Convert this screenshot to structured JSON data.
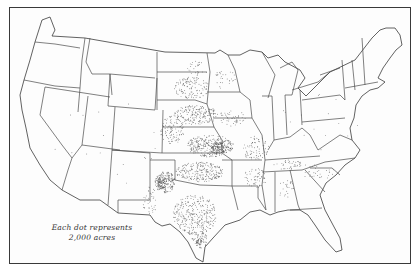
{
  "map": {
    "type": "dot-density",
    "region": "United States",
    "legend": {
      "line1": "Each dot represents",
      "line2": "2,000 acres"
    },
    "colors": {
      "ink": "#3a3a3a",
      "dot": "#555555",
      "paper": "#fdfdfd"
    },
    "dot_clusters": [
      {
        "name": "south-dakota",
        "cx": 192,
        "cy": 88,
        "rx": 18,
        "ry": 11,
        "n": 120
      },
      {
        "name": "north-dakota-east",
        "cx": 197,
        "cy": 70,
        "rx": 10,
        "ry": 9,
        "n": 30
      },
      {
        "name": "nebraska",
        "cx": 196,
        "cy": 115,
        "rx": 22,
        "ry": 10,
        "n": 200
      },
      {
        "name": "kansas",
        "cx": 210,
        "cy": 146,
        "rx": 24,
        "ry": 11,
        "n": 320
      },
      {
        "name": "kansas-dense",
        "cx": 218,
        "cy": 148,
        "rx": 9,
        "ry": 6,
        "n": 120
      },
      {
        "name": "colorado-east",
        "cx": 172,
        "cy": 130,
        "rx": 12,
        "ry": 14,
        "n": 110
      },
      {
        "name": "oklahoma",
        "cx": 200,
        "cy": 172,
        "rx": 24,
        "ry": 10,
        "n": 240
      },
      {
        "name": "texas-panhandle",
        "cx": 165,
        "cy": 182,
        "rx": 10,
        "ry": 11,
        "n": 180
      },
      {
        "name": "texas-panhandle-dense",
        "cx": 162,
        "cy": 183,
        "rx": 5,
        "ry": 6,
        "n": 90
      },
      {
        "name": "texas-central",
        "cx": 195,
        "cy": 215,
        "rx": 22,
        "ry": 20,
        "n": 330
      },
      {
        "name": "texas-south",
        "cx": 200,
        "cy": 240,
        "rx": 8,
        "ry": 8,
        "n": 60
      },
      {
        "name": "texas-south-dense",
        "cx": 199,
        "cy": 242,
        "rx": 3,
        "ry": 3,
        "n": 30
      },
      {
        "name": "missouri",
        "cx": 255,
        "cy": 148,
        "rx": 14,
        "ry": 12,
        "n": 80
      },
      {
        "name": "iowa",
        "cx": 232,
        "cy": 118,
        "rx": 14,
        "ry": 8,
        "n": 50
      },
      {
        "name": "minnesota",
        "cx": 225,
        "cy": 80,
        "rx": 12,
        "ry": 10,
        "n": 30
      },
      {
        "name": "arkansas",
        "cx": 255,
        "cy": 178,
        "rx": 12,
        "ry": 10,
        "n": 60
      },
      {
        "name": "tennessee",
        "cx": 290,
        "cy": 165,
        "rx": 16,
        "ry": 5,
        "n": 40
      },
      {
        "name": "alabama",
        "cx": 285,
        "cy": 188,
        "rx": 10,
        "ry": 10,
        "n": 25
      },
      {
        "name": "carolinas",
        "cx": 318,
        "cy": 172,
        "rx": 16,
        "ry": 8,
        "n": 30
      },
      {
        "name": "new-mexico-east",
        "cx": 150,
        "cy": 200,
        "rx": 8,
        "ry": 14,
        "n": 40
      },
      {
        "name": "scattered-west",
        "cx": 110,
        "cy": 140,
        "rx": 60,
        "ry": 50,
        "n": 18
      },
      {
        "name": "scattered-east",
        "cx": 320,
        "cy": 120,
        "rx": 40,
        "ry": 30,
        "n": 15
      }
    ]
  }
}
